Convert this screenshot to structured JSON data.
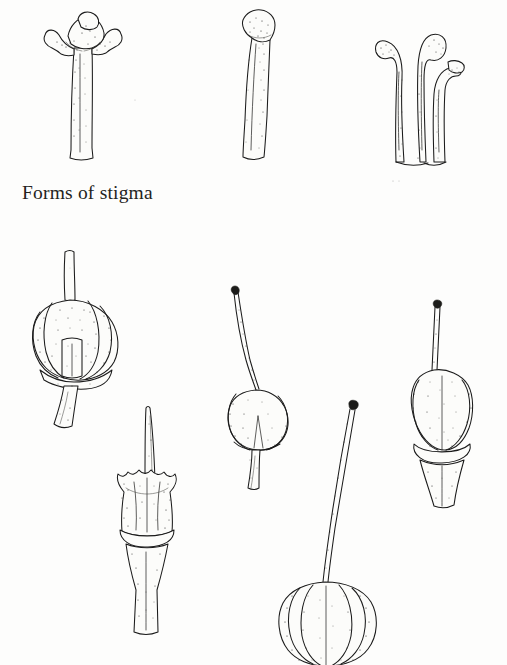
{
  "plate": {
    "kind": "scanned-botanical-illustration",
    "width": 507,
    "height": 665,
    "background_color": "#fdfdfc",
    "ink_color": "#1b1b1b",
    "caption": "Forms of stigma",
    "caption_position": {
      "x": 22,
      "y": 182
    },
    "technique": "pen-and-ink line drawing with stipple shading"
  },
  "figures": {
    "top_row_label": "Forms of stigma",
    "top_row": [
      {
        "id": "stigma-capitate",
        "name": "capitate lobed stigma",
        "description": "broad mushroom-like lobed head on a straight stout style",
        "position": {
          "x": 58,
          "y": 10,
          "width": 64,
          "height": 152
        }
      },
      {
        "id": "stigma-clavate",
        "name": "clavate simple stigma",
        "description": "club-shaped style with a slightly swollen knobbed tip",
        "position": {
          "x": 236,
          "y": 14,
          "width": 40,
          "height": 148
        }
      },
      {
        "id": "stigma-trifid",
        "name": "trifid branched stigma",
        "description": "three recurved branches with clubbed tips arising from a common base",
        "position": {
          "x": 374,
          "y": 10,
          "width": 82,
          "height": 160
        }
      }
    ],
    "bottom_row": [
      {
        "id": "ovary-sectioned",
        "name": "sectioned ovary with straight style",
        "description": "cut-away ovary showing inner placenta, blunt erect style, stout pedicel",
        "position": {
          "x": 32,
          "y": 247,
          "width": 100,
          "height": 200
        }
      },
      {
        "id": "ovary-ribbed-pointed-style",
        "name": "ribbed ovary with pointed style",
        "description": "crested ribbed ovary, sharply pointed erect style, flared tapering pedicel",
        "position": {
          "x": 104,
          "y": 402,
          "width": 84,
          "height": 232
        }
      },
      {
        "id": "ovary-small-curved-style",
        "name": "small ovary with long curved style",
        "description": "rounded ovary, slender arching style tipped by a dark knob stigma",
        "position": {
          "x": 222,
          "y": 288,
          "width": 76,
          "height": 182
        }
      },
      {
        "id": "ovary-lobed-long-style",
        "name": "lobed ovary with very long style",
        "description": "large heart-shaped lobed ovary with a very long slender style and knob stigma",
        "position": {
          "x": 282,
          "y": 400,
          "width": 118,
          "height": 265
        }
      },
      {
        "id": "ovary-ovate-receptacle",
        "name": "ovate ovary on flared receptacle",
        "description": "ovate stippled ovary with slender knobbed style seated on a flared receptacle",
        "position": {
          "x": 410,
          "y": 300,
          "width": 72,
          "height": 215
        }
      }
    ]
  }
}
